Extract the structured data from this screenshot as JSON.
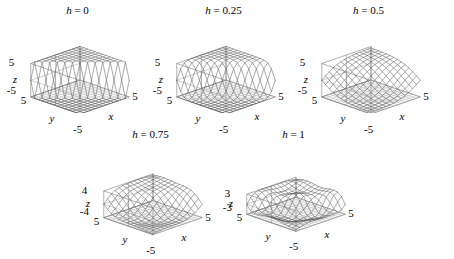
{
  "figure": {
    "width": 454,
    "height": 259,
    "background": "#ffffff",
    "line_color": "#555555",
    "axis_color": "#888888",
    "text_color": "#000000",
    "rows": 2,
    "columns": 3
  },
  "chart_data": {
    "type": "line",
    "plot_kind": "3d-surface-mesh",
    "title": "",
    "xlabel": "x",
    "ylabel": "y",
    "zlabel": "z",
    "grid": false,
    "legend": "none",
    "shared": {
      "xlim": [
        -5,
        5
      ],
      "ylim": [
        -5,
        5
      ],
      "x_ticks": [
        "-5",
        "5"
      ],
      "y_ticks": [
        "5",
        "-5"
      ],
      "mesh_n": 13,
      "elev": 26,
      "azim": -55,
      "surface_formula": "z = A * tanh( (x+y) / (h_scale) ) modulated by ripple term"
    },
    "panels": [
      {
        "id": "panel-h-0",
        "title_prefix": "h",
        "title_eq": "=",
        "title_value": "0",
        "h": 0,
        "zlim": [
          -5,
          5
        ],
        "z_ticks": [
          "5",
          "-5"
        ],
        "z_top_label": "5",
        "z_bottom_label": "-5",
        "x_left_label": "-5",
        "x_right_label": "5",
        "y_left_label": "5",
        "amplitude": 5,
        "sharpness": 0.02,
        "ripple": 0.0,
        "description": "hard step / sign discontinuity with flat plateaus at +5 and -5"
      },
      {
        "id": "panel-h-025",
        "title_prefix": "h",
        "title_eq": "=",
        "title_value": "0.25",
        "h": 0.25,
        "zlim": [
          -5,
          5
        ],
        "z_ticks": [
          "5",
          "-5"
        ],
        "z_top_label": "5",
        "z_bottom_label": "-5",
        "x_left_label": "-5",
        "x_right_label": "5",
        "y_left_label": "5",
        "amplitude": 5,
        "sharpness": 0.55,
        "ripple": 0.0,
        "description": "smoothed step, rounded saddle-like transition"
      },
      {
        "id": "panel-h-05",
        "title_prefix": "h",
        "title_eq": "=",
        "title_value": "0.5",
        "h": 0.5,
        "zlim": [
          -5,
          5
        ],
        "z_ticks": [
          "5",
          "-5"
        ],
        "z_top_label": "5",
        "z_bottom_label": "-5",
        "x_left_label": "-5",
        "x_right_label": "5",
        "y_left_label": "5",
        "amplitude": 4.6,
        "sharpness": 1.9,
        "ripple": 0.0,
        "description": "almost flat tilted plane"
      },
      {
        "id": "panel-h-075",
        "title_prefix": "h",
        "title_eq": "=",
        "title_value": "0.75",
        "h": 0.75,
        "zlim": [
          -4,
          4
        ],
        "z_ticks": [
          "4",
          "-4"
        ],
        "z_top_label": "4",
        "z_bottom_label": "-4",
        "x_left_label": "-5",
        "x_right_label": "5",
        "y_left_label": "5",
        "amplitude": 4,
        "sharpness": 1.2,
        "ripple": 0.5,
        "description": "tilted ramp with ripples near the high edge"
      },
      {
        "id": "panel-h-1",
        "title_prefix": "h",
        "title_eq": "=",
        "title_value": "1",
        "h": 1,
        "zlim": [
          -3,
          3
        ],
        "z_ticks": [
          "3",
          "-3"
        ],
        "z_top_label": "3",
        "z_bottom_label": "-3",
        "x_left_label": "-5",
        "x_right_label": "5",
        "y_left_label": "5",
        "amplitude": 3,
        "sharpness": 0.5,
        "ripple": 1.25,
        "description": "basin with steep back walls and rippled floor"
      }
    ]
  }
}
